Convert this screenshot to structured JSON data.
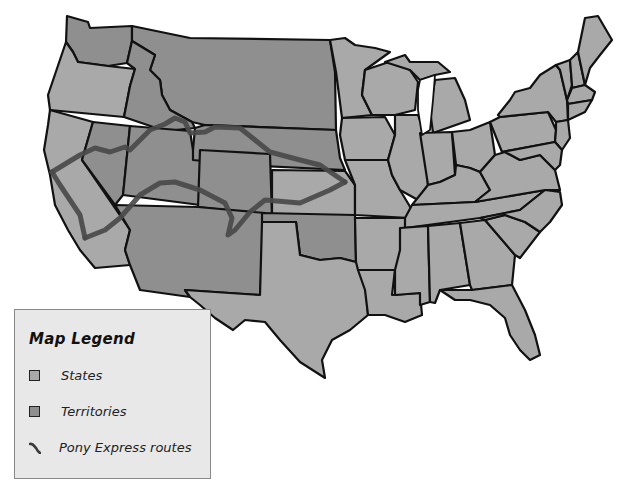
{
  "map": {
    "title": "United States map with Pony Express routes",
    "colors": {
      "state_fill": "#a9a9a9",
      "territory_fill": "#8f8f8f",
      "route": "#4a4a4a",
      "border": "#111111",
      "legend_bg": "#e8e8e8"
    }
  },
  "legend": {
    "title": "Map Legend",
    "items": [
      {
        "label": "States",
        "icon": "state-swatch-icon",
        "color": "#a9a9a9"
      },
      {
        "label": "Territories",
        "icon": "territory-swatch-icon",
        "color": "#8f8f8f"
      },
      {
        "label": "Pony Express routes",
        "icon": "route-line-icon",
        "color": "#4a4a4a"
      }
    ]
  }
}
